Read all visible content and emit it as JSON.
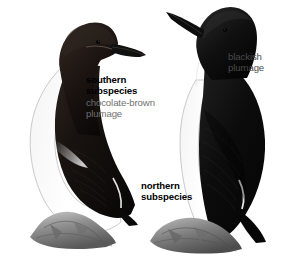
{
  "figure": {
    "background_color": "#ffffff",
    "width": 299,
    "height": 274
  },
  "annotations": {
    "southern_subspecies": {
      "heading": "southern\nsubspecies",
      "description": "chocolate-brown\nplumage",
      "heading_color": "#000000",
      "description_color": "#6f6f6f"
    },
    "northern_subspecies": {
      "heading": "northern\nsubspecies",
      "heading_color": "#000000"
    },
    "blackish": {
      "description": "blackish\nplumage",
      "description_color": "#4a4a4a"
    }
  },
  "birds": [
    {
      "name": "southern-subspecies-bird",
      "facing": "right",
      "plumage_color": "#1a1512",
      "belly_color": "#ffffff",
      "outline_color": "#b9b9b9",
      "position": "left"
    },
    {
      "name": "northern-subspecies-bird",
      "facing": "left",
      "plumage_color": "#0b0b0b",
      "belly_color": "#ffffff",
      "outline_color": "#b9b9b9",
      "position": "right"
    }
  ],
  "rocks": {
    "name": "rock-ledge",
    "fill_color": "#8e8e8e",
    "shade_color": "#5e5e5e"
  }
}
